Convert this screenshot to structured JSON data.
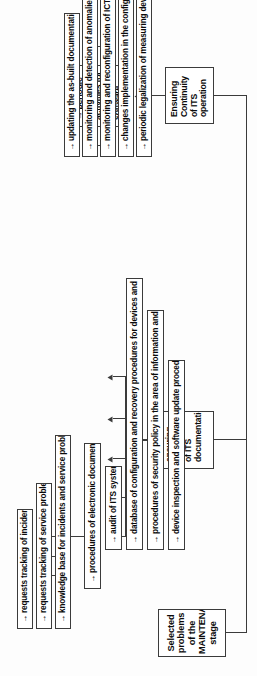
{
  "diagram": {
    "title": "Selected problems of the MAINTENANCE stage",
    "orientation": "rotated-90-ccw",
    "arrow_glyph": "→",
    "colors": {
      "line": "#3b3b3b",
      "box_fill": "#ffffff",
      "text": "#0b0b0b",
      "page_bg": "#fdfdfd"
    },
    "groups": [
      {
        "id": "consistency",
        "label": "ensuring\nconsistency\nof ITS\ndocumentation",
        "label_lines": [
          "ensuring",
          "consistency",
          "of ITS",
          "documentation"
        ],
        "items": [
          {
            "id": "proc-electronic-doc",
            "label": "procedures of electronic documenting"
          },
          {
            "id": "audit-its",
            "label": "audit of ITS system"
          },
          {
            "id": "db-config-recovery",
            "label": "database of configuration and recovery procedures for devices and systems"
          },
          {
            "id": "security-policy",
            "label": "procedures of security policy in the area of information and data"
          },
          {
            "id": "device-inspection",
            "label": "device inspection and software update procedures"
          }
        ]
      },
      {
        "id": "continuity",
        "label": "Ensuring\nContinuity\nof ITS operation",
        "label_lines": [
          "Ensuring",
          "Continuity",
          "of ITS operation"
        ],
        "items": [
          {
            "id": "updating-asbuilt",
            "label": "updating the as-built documentation"
          },
          {
            "id": "monitoring-anomalies",
            "label": "monitoring and detection of anomalies in the ITS system functioning"
          },
          {
            "id": "monitoring-ict",
            "label": "monitoring and reconfiguration of ICT network infrastructure"
          },
          {
            "id": "changes-config",
            "label": "changes implementation in the configuration of ITS"
          },
          {
            "id": "periodic-legalization",
            "label": "periodic legalization of measuring devices"
          }
        ]
      },
      {
        "id": "periodic-maintenance",
        "label": "periodic maintenance activities for devices and software",
        "label_lines": [
          "periodic",
          "maintenance",
          "activities for",
          "devices and",
          "software"
        ],
        "items": []
      }
    ],
    "sub_items": [
      {
        "id": "req-track-incidents",
        "label": "requests tracking of incidents"
      },
      {
        "id": "req-track-service",
        "label": "requests tracking of service problems"
      },
      {
        "id": "knowledge-base",
        "label": "knowledge base for incidents and service problems"
      }
    ]
  }
}
